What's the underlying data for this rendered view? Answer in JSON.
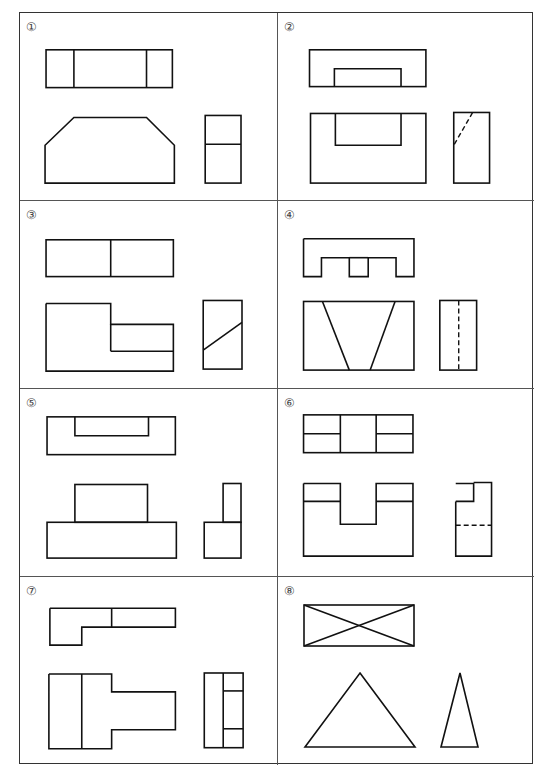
{
  "header_fragment": "",
  "problems": [
    {
      "number": "①",
      "label": "Problem 1"
    },
    {
      "number": "②",
      "label": "Problem 2"
    },
    {
      "number": "③",
      "label": "Problem 3"
    },
    {
      "number": "④",
      "label": "Problem 4"
    },
    {
      "number": "⑤",
      "label": "Problem 5"
    },
    {
      "number": "⑥",
      "label": "Problem 6"
    },
    {
      "number": "⑦",
      "label": "Problem 7"
    },
    {
      "number": "⑧",
      "label": "Problem 8"
    }
  ],
  "colors": {
    "line": "#111111",
    "border": "#333333",
    "background": "#ffffff"
  }
}
